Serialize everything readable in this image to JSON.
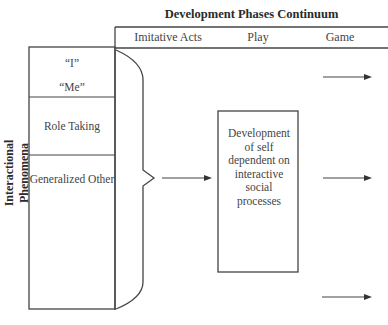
{
  "title": "Development Phases Continuum",
  "phases": [
    {
      "label": "Imitative Acts"
    },
    {
      "label": "Play"
    },
    {
      "label": "Game"
    }
  ],
  "row_axis_label": "Interactional Phenomena",
  "phenomena": [
    {
      "label": "“I”"
    },
    {
      "label": "“Me”"
    },
    {
      "label": "Role Taking"
    },
    {
      "label": "Generalized Other"
    }
  ],
  "center_box": {
    "lines": [
      "Development",
      "of self",
      "dependent on",
      "interactive",
      "social",
      "processes"
    ]
  },
  "arrows": {
    "count": 4
  }
}
